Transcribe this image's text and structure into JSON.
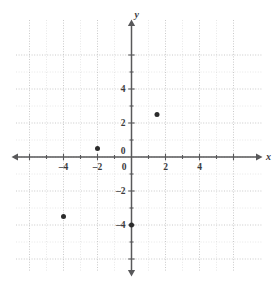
{
  "chart_data": {
    "type": "scatter",
    "title": "",
    "xlabel": "x",
    "ylabel": "y",
    "xlim": [
      -6.8,
      6.8
    ],
    "ylim": [
      -6.8,
      6.8
    ],
    "grid": true,
    "grid_style": "dotted",
    "major_grid_step": 2,
    "minor_grid_step": 1,
    "legend": false,
    "x_ticks": [
      -4,
      -2,
      0,
      2,
      4
    ],
    "y_ticks": [
      4,
      2,
      0,
      -2,
      -4
    ],
    "x_tick_labels": [
      "–4",
      "–2",
      "0",
      "2",
      "4"
    ],
    "y_tick_labels": [
      "4",
      "2",
      "0",
      "–2",
      "–4"
    ],
    "points": [
      {
        "label": "point-1",
        "x": -4,
        "y": -3.5
      },
      {
        "label": "point-2",
        "x": -2,
        "y": 0.5
      },
      {
        "label": "point-3",
        "x": 0,
        "y": -4
      },
      {
        "label": "point-4",
        "x": 1.5,
        "y": 2.5
      }
    ],
    "point_color": "#2b2b2b",
    "axis_color": "#58585a",
    "grid_color": "#d8d8d8",
    "major_grid_color": "#bdbdbd"
  },
  "axes": {
    "x_label": "x",
    "y_label": "y"
  }
}
